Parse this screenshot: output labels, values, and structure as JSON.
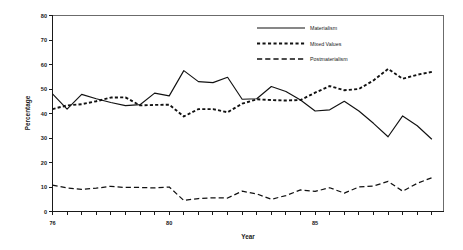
{
  "chart_data": {
    "type": "line",
    "title": "",
    "xlabel": "Year",
    "ylabel": "Percentage",
    "xlim": [
      1976.0,
      1989.4
    ],
    "ylim": [
      0,
      80
    ],
    "ytick_step": 10,
    "yticks": [
      0,
      10,
      20,
      30,
      40,
      50,
      60,
      70,
      80
    ],
    "ytick_labels": [
      "0",
      "10",
      "20",
      "30",
      "40",
      "50",
      "60",
      "70",
      "80"
    ],
    "xticks": [
      1976,
      1980,
      1985
    ],
    "xtick_labels": [
      "76",
      "80",
      "85"
    ],
    "xtick_minor_step": 0.5,
    "grid": false,
    "legend_position": "top-right",
    "x": [
      1976.0,
      1976.5,
      1977.0,
      1977.5,
      1978.0,
      1978.5,
      1979.0,
      1979.5,
      1980.0,
      1980.5,
      1981.0,
      1981.5,
      1982.0,
      1982.5,
      1983.0,
      1983.5,
      1984.0,
      1984.5,
      1985.0,
      1985.5,
      1986.0,
      1986.5,
      1987.0,
      1987.5,
      1988.0,
      1988.5,
      1989.0
    ],
    "series": [
      {
        "name": "Materialism",
        "style": "solid",
        "values": [
          48.0,
          41.8,
          47.8,
          46.0,
          44.5,
          43.2,
          43.6,
          48.3,
          47.2,
          57.5,
          53.0,
          52.6,
          54.8,
          45.8,
          46.0,
          51.0,
          49.0,
          45.5,
          41.0,
          41.5,
          45.0,
          41.0,
          36.0,
          30.5,
          39.0,
          35.0,
          29.5
        ]
      },
      {
        "name": "Mixed Values",
        "style": "dotted",
        "values": [
          41.8,
          43.3,
          43.8,
          45.0,
          46.5,
          46.6,
          43.3,
          43.5,
          43.6,
          38.8,
          41.8,
          41.8,
          40.5,
          44.0,
          45.8,
          45.5,
          45.3,
          45.5,
          48.5,
          51.2,
          49.5,
          50.0,
          53.5,
          58.2,
          54.2,
          55.8,
          57.0
        ]
      },
      {
        "name": "Postmaterialism",
        "style": "dashed",
        "values": [
          10.8,
          9.6,
          9.0,
          9.5,
          10.3,
          9.8,
          9.8,
          9.6,
          10.0,
          4.5,
          5.3,
          5.6,
          5.5,
          8.3,
          7.2,
          5.0,
          6.5,
          8.8,
          8.2,
          9.7,
          7.5,
          10.0,
          10.4,
          12.3,
          8.3,
          11.5,
          13.8
        ]
      }
    ]
  },
  "legend": {
    "items": [
      {
        "label": "Materialism"
      },
      {
        "label": "Mixed Values"
      },
      {
        "label": "Postmaterialism"
      }
    ]
  },
  "axes": {
    "y_title": "Percentage",
    "x_title": "Year"
  }
}
